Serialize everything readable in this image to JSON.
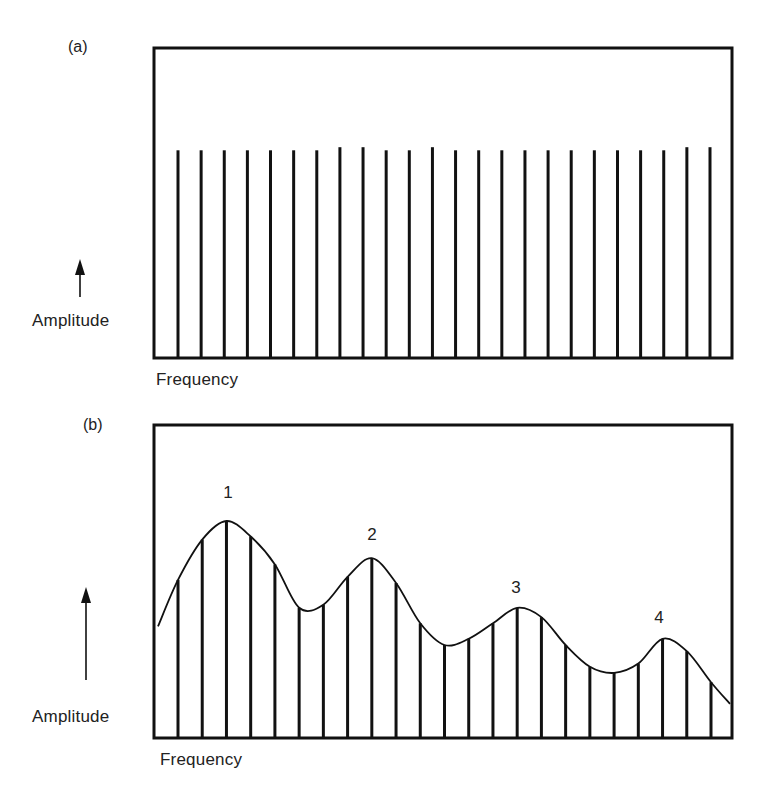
{
  "figure": {
    "panels": [
      {
        "id": "a",
        "label": "(a)",
        "y_axis_label": "Amplitude",
        "x_axis_label": "Frequency"
      },
      {
        "id": "b",
        "label": "(b)",
        "y_axis_label": "Amplitude",
        "x_axis_label": "Frequency",
        "peak_labels": [
          "1",
          "2",
          "3",
          "4"
        ]
      }
    ]
  },
  "chart_data": [
    {
      "type": "bar",
      "title": "(a)",
      "description": "Line spectrum of equal-amplitude harmonics",
      "xlabel": "Frequency",
      "ylabel": "Amplitude",
      "ylim": [
        0,
        100
      ],
      "grid": false,
      "legend": "none",
      "harmonic_count": 24,
      "x": [
        1,
        2,
        3,
        4,
        5,
        6,
        7,
        8,
        9,
        10,
        11,
        12,
        13,
        14,
        15,
        16,
        17,
        18,
        19,
        20,
        21,
        22,
        23,
        24
      ],
      "values": [
        67,
        67,
        67,
        67,
        67,
        67,
        67,
        68,
        68,
        67,
        67,
        68,
        67,
        67,
        67,
        67,
        67,
        67,
        67,
        67,
        67,
        67,
        68,
        68
      ]
    },
    {
      "type": "bar",
      "title": "(b)",
      "description": "Same harmonics shaped by a resonance envelope with four formant peaks",
      "xlabel": "Frequency",
      "ylabel": "Amplitude",
      "ylim": [
        0,
        100
      ],
      "grid": false,
      "legend": "none",
      "harmonic_count": 23,
      "x": [
        1,
        2,
        3,
        4,
        5,
        6,
        7,
        8,
        9,
        10,
        11,
        12,
        13,
        14,
        15,
        16,
        17,
        18,
        19,
        20,
        21,
        22,
        23
      ],
      "values": [
        51,
        64,
        70,
        65,
        56,
        42,
        43,
        52,
        58,
        50,
        37,
        30,
        32,
        37,
        42,
        39,
        30,
        23,
        21,
        24,
        32,
        28,
        18
      ],
      "envelope": {
        "start_value": 36,
        "end_value": 11,
        "peaks": [
          {
            "label": "1",
            "harmonic": 3,
            "value": 70
          },
          {
            "label": "2",
            "harmonic": 9,
            "value": 59
          },
          {
            "label": "3",
            "harmonic": 15,
            "value": 43
          },
          {
            "label": "4",
            "harmonic": 21,
            "value": 33
          }
        ],
        "troughs": [
          {
            "between": [
              "1",
              "2"
            ],
            "value": 41
          },
          {
            "between": [
              "2",
              "3"
            ],
            "value": 29
          },
          {
            "between": [
              "3",
              "4"
            ],
            "value": 21
          }
        ]
      }
    }
  ]
}
